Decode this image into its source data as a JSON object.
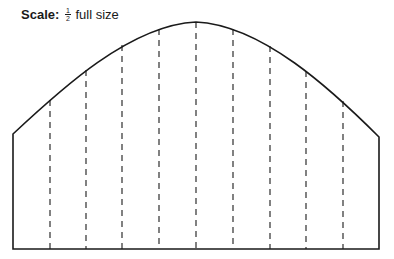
{
  "caption": {
    "label": "Scale:",
    "fraction_numerator": "1",
    "fraction_denominator": "2",
    "text": "full size"
  },
  "diagram": {
    "outline": {
      "left_x": 13,
      "right_x": 379,
      "bottom_y": 249,
      "left_corner_y": 134,
      "right_corner_y": 137,
      "apex_x": 196,
      "apex_y": 22
    },
    "dashed_lines": [
      {
        "x": 50,
        "top_y": 100
      },
      {
        "x": 86,
        "top_y": 70
      },
      {
        "x": 122,
        "top_y": 45
      },
      {
        "x": 159,
        "top_y": 29
      },
      {
        "x": 196,
        "top_y": 22
      },
      {
        "x": 233,
        "top_y": 29
      },
      {
        "x": 270,
        "top_y": 46
      },
      {
        "x": 306,
        "top_y": 71
      },
      {
        "x": 343,
        "top_y": 101
      }
    ],
    "stroke_color": "#1a1a1a"
  }
}
